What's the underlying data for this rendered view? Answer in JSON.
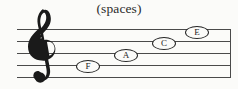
{
  "figure": {
    "caption": "(spaces)",
    "ink_color": "#242424",
    "staff_line_color": "#4a4a4a",
    "background_color": "#fbfbf9"
  },
  "staff": {
    "clef": "treble-clef",
    "line_count": 5,
    "space_count": 4,
    "has_right_barline": true
  },
  "notes": [
    {
      "label": "F",
      "space_number": 1,
      "x": 76,
      "y": 60
    },
    {
      "label": "A",
      "space_number": 2,
      "x": 114,
      "y": 49
    },
    {
      "label": "C",
      "space_number": 3,
      "x": 152,
      "y": 37
    },
    {
      "label": "E",
      "space_number": 4,
      "x": 185,
      "y": 26
    }
  ]
}
